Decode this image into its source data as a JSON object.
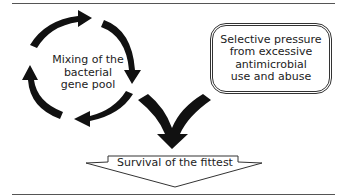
{
  "diagram": {
    "cycle": {
      "label": "Mixing of the bacterial gene pool",
      "lines": [
        "Mixing of the",
        "bacterial",
        "gene pool"
      ]
    },
    "pressure_box": {
      "label": "Selective pressure from excessive antimicrobial use and abuse",
      "lines": [
        "Selective pressure",
        "from excessive",
        "antimicrobial",
        "use and abuse"
      ]
    },
    "outcome_arrow": {
      "label": "Survival of the fittest"
    },
    "colors": {
      "arrow_fill": "#111111",
      "outline": "#333333",
      "text": "#222222",
      "background": "#ffffff"
    }
  }
}
